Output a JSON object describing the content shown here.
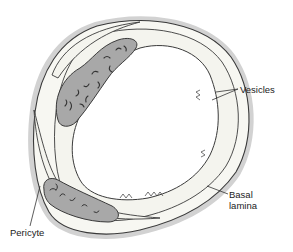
{
  "diagram": {
    "labels": {
      "vesicles": "Vesicles",
      "basal_lamina_line1": "Basal",
      "basal_lamina_line2": "lamina",
      "pericyte": "Pericyte"
    },
    "colors": {
      "outline": "#3a3a3a",
      "halo": "#c8c8c8",
      "nucleus_fill": "#a8a8a8",
      "chromatin": "#333333",
      "cytoplasm": "#ffffff",
      "lumen": "#ffffff"
    }
  }
}
